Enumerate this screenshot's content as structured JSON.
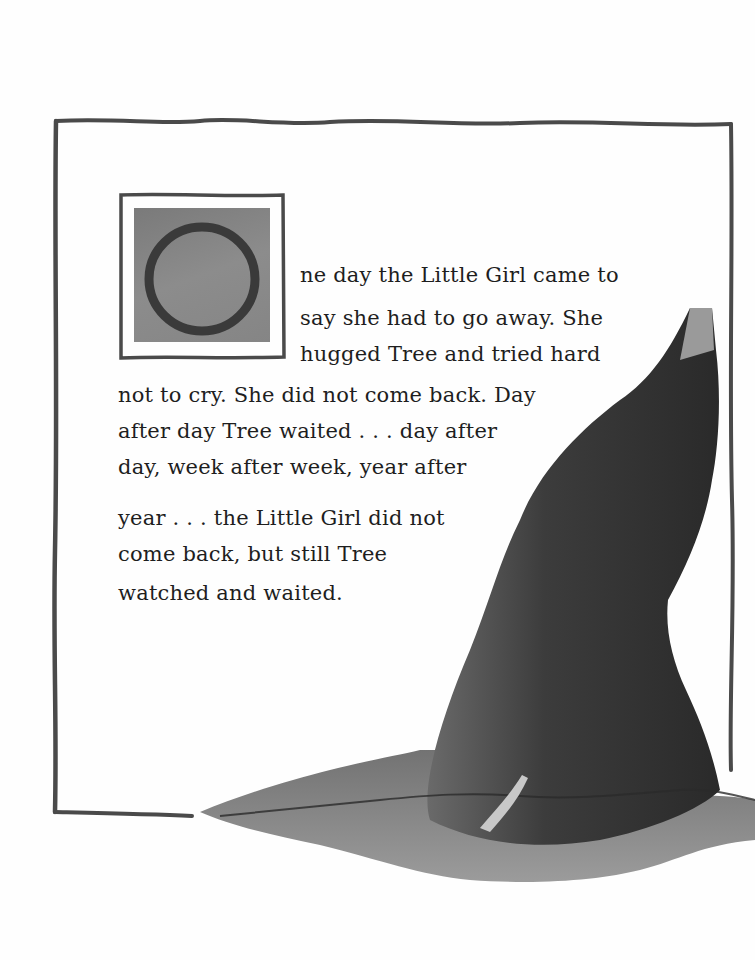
{
  "page": {
    "drop_cap": "O",
    "story_lines": [
      "ne day the Little Girl came to",
      "say she had to go away. She",
      "hugged Tree and tried hard",
      "not to cry. She did not come back. Day",
      "after day Tree waited . . . day after",
      "day, week after week, year after",
      "year . . . the Little Girl did not",
      "come back, but still Tree",
      "watched and waited."
    ],
    "colors": {
      "frame": "#4a4a4a",
      "ink": "#1e1e1e",
      "dropcap_fill": "#858585",
      "stump_dark": "#2e2e2e",
      "stump_mid": "#555555",
      "stump_light": "#8a8a8a"
    }
  }
}
